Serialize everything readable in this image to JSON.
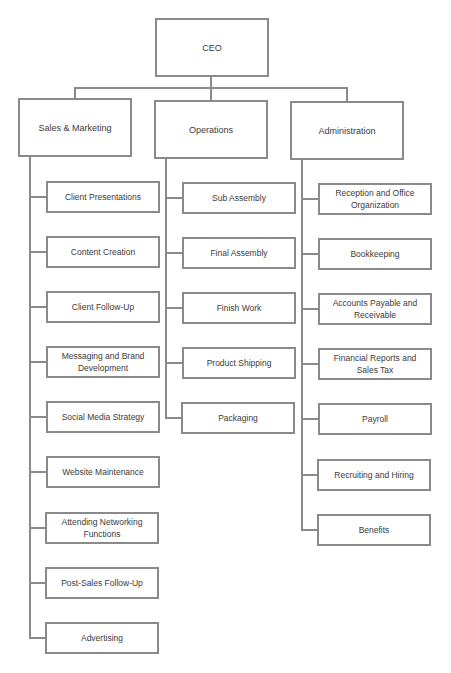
{
  "chart": {
    "root": {
      "label": "CEO"
    },
    "departments": [
      {
        "label": "Sales & Marketing",
        "children": [
          "Client Presentations",
          "Content Creation",
          "Client Follow-Up",
          "Messaging and Brand Development",
          "Social Media Strategy",
          "Website Maintenance",
          "Attending Networking Functions",
          "Post-Sales Follow-Up",
          "Advertising"
        ]
      },
      {
        "label": "Operations",
        "children": [
          "Sub Assembly",
          "Final Assembly",
          "Finish Work",
          "Product Shipping",
          "Packaging"
        ]
      },
      {
        "label": "Administration",
        "children": [
          "Reception and Office Organization",
          "Bookkeeping",
          "Accounts Payable and Receivable",
          "Financial Reports and Sales Tax",
          "Payroll",
          "Recruiting and Hiring",
          "Benefits"
        ]
      }
    ]
  },
  "colors": {
    "line": "#8a8a8a",
    "text": "#3a3a3a",
    "background": "#ffffff"
  }
}
